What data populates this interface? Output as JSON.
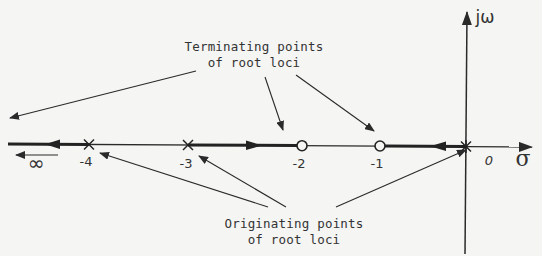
{
  "figure": {
    "axes": {
      "real_axis_label": "σ",
      "imag_axis_label": "jω",
      "origin_label": "0",
      "infinity_label": "∞"
    },
    "ticks": [
      "-4",
      "-3",
      "-2",
      "-1"
    ],
    "poles": [
      {
        "value": -4,
        "marker": "x"
      },
      {
        "value": -3,
        "marker": "x"
      },
      {
        "value": 0,
        "marker": "x"
      }
    ],
    "zeros": [
      {
        "value": -2,
        "marker": "o"
      },
      {
        "value": -1,
        "marker": "o"
      }
    ],
    "locus_segments": [
      {
        "from": -3,
        "to": -2,
        "direction": "right"
      },
      {
        "from": 0,
        "to": -1,
        "direction": "left"
      },
      {
        "from": -4,
        "to": "-inf",
        "direction": "left"
      }
    ],
    "captions": {
      "terminating": {
        "line1": "Terminating points",
        "line2": "of root loci"
      },
      "originating": {
        "line1": "Originating points",
        "line2": "of root loci"
      }
    },
    "colors": {
      "ink": "#2a2a2a",
      "paper": "#f5f5f3"
    }
  }
}
